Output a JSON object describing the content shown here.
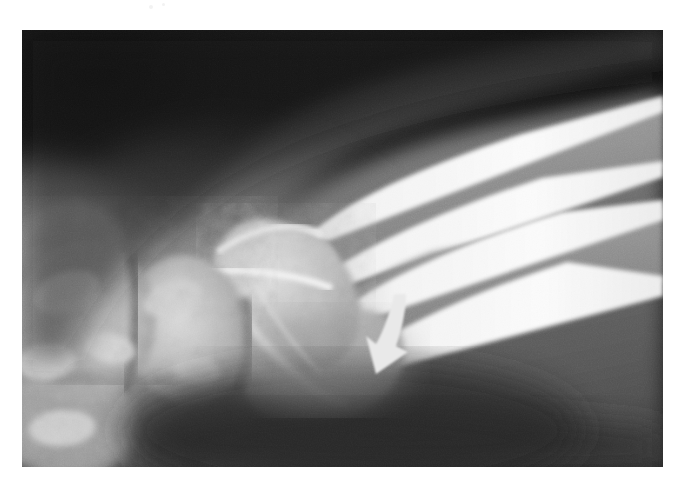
{
  "page": {
    "kind": "radiograph-figure",
    "background_color": "#ffffff",
    "width": 684,
    "height": 481
  },
  "radiograph": {
    "name": "wrist-radiograph",
    "modality": "X-ray",
    "view": "lateral-oblique wrist",
    "anatomy": "distal radius, distal ulna, carpal bones",
    "frame": {
      "x": 22,
      "y": 30,
      "width": 641,
      "height": 437
    },
    "tones": {
      "background_dark": "#1d1d1d",
      "background_darkest": "#101010",
      "soft_tissue_mid": "#6e6e6e",
      "soft_tissue_light": "#8e8e8e",
      "bone_mid": "#b4b4b4",
      "bone_bright": "#dedede",
      "cortex_white": "#f2f2f2"
    },
    "noise": {
      "type": "film-grain",
      "visible": true
    }
  },
  "annotation": {
    "arrow": {
      "name": "pointer-arrow",
      "color": "#e9e9e9",
      "shape": "curved tapered arrow",
      "direction": "down-left",
      "tail": {
        "x": 392,
        "y": 294
      },
      "tip": {
        "x": 376,
        "y": 345
      },
      "points_to": "distal radius cortex / soft-tissue region"
    }
  },
  "artifacts": {
    "specks": [
      {
        "x": 150,
        "y": 6,
        "r": 2
      },
      {
        "x": 163,
        "y": 4,
        "r": 1
      }
    ]
  }
}
